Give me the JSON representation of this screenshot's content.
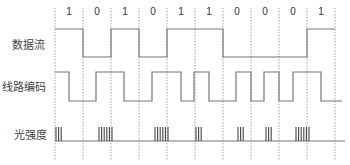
{
  "diagram": {
    "rows": [
      {
        "id": "data",
        "label": "数据流"
      },
      {
        "id": "line",
        "label": "线路编码"
      },
      {
        "id": "light",
        "label": "光强度"
      }
    ],
    "bits": [
      "1",
      "0",
      "1",
      "0",
      "1",
      "1",
      "0",
      "0",
      "0",
      "1"
    ],
    "grid": {
      "x0": 55,
      "bit_width": 28,
      "lines": 11,
      "color": "#888888"
    },
    "data_stream": {
      "high_y": 29,
      "low_y": 57
    },
    "line_code": {
      "high_y": 72,
      "low_y": 101,
      "high_segments": [
        [
          55,
          69
        ],
        [
          96,
          124
        ],
        [
          152,
          181
        ],
        [
          194,
          209
        ],
        [
          236,
          251
        ],
        [
          264,
          279
        ],
        [
          293,
          321
        ]
      ],
      "end_x": 342
    },
    "light": {
      "baseline_y": 141,
      "top_y": 127,
      "pulse_groups": [
        {
          "start": 56,
          "count": 3
        },
        {
          "start": 99,
          "count": 6
        },
        {
          "start": 155,
          "count": 6
        },
        {
          "start": 196,
          "count": 3
        },
        {
          "start": 238,
          "count": 3
        },
        {
          "start": 266,
          "count": 3
        },
        {
          "start": 296,
          "count": 6
        }
      ],
      "end_x": 345
    },
    "colors": {
      "signal": "#777777",
      "pulse": "#444444",
      "label": "#444444"
    }
  }
}
